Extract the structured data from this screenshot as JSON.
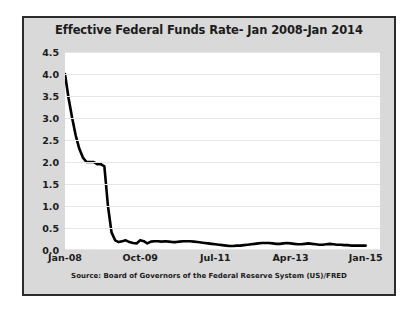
{
  "chart_data": {
    "type": "line",
    "title": "Effective Federal Funds Rate- Jan 2008-Jan 2014",
    "source_note": "Source: Board of Governors of the Federal Reserve System (US)/FRED",
    "xlabel": "",
    "ylabel": "",
    "ylim": [
      0.0,
      4.5
    ],
    "ytick_labels": [
      "0.0",
      "0.5",
      "1.0",
      "1.5",
      "2.0",
      "2.5",
      "3.0",
      "3.5",
      "4.0",
      "4.5"
    ],
    "ytick_values": [
      0.0,
      0.5,
      1.0,
      1.5,
      2.0,
      2.5,
      3.0,
      3.5,
      4.0,
      4.5
    ],
    "xtick_labels": [
      "Jan-08",
      "Oct-09",
      "Jul-11",
      "Apr-13",
      "Jan-15"
    ],
    "xtick_positions": [
      0,
      21,
      42,
      63,
      84
    ],
    "xlim": [
      0,
      88
    ],
    "grid": true,
    "legend": false,
    "line_color": "#000000",
    "line_width": 2.6,
    "plot_background": "#ffffff",
    "panel_background": "#d9d9d9",
    "border_color": "#2b2b2b",
    "series": [
      {
        "name": "Effective Federal Funds Rate",
        "x": [
          0,
          1,
          2,
          3,
          4,
          5,
          6,
          7,
          8,
          9,
          10,
          11,
          12,
          13,
          14,
          15,
          16,
          17,
          18,
          19,
          20,
          21,
          22,
          23,
          24,
          25,
          26,
          27,
          28,
          29,
          30,
          31,
          32,
          33,
          34,
          35,
          36,
          37,
          38,
          39,
          40,
          41,
          42,
          43,
          44,
          45,
          46,
          47,
          48,
          49,
          50,
          51,
          52,
          53,
          54,
          55,
          56,
          57,
          58,
          59,
          60,
          61,
          62,
          63,
          64,
          65,
          66,
          67,
          68,
          69,
          70,
          71,
          72,
          73,
          74,
          75,
          76,
          77,
          78,
          79,
          80,
          81,
          82,
          83,
          84
        ],
        "values": [
          4.0,
          3.45,
          3.0,
          2.6,
          2.3,
          2.1,
          2.0,
          2.0,
          2.0,
          1.95,
          1.95,
          1.9,
          1.0,
          0.4,
          0.22,
          0.18,
          0.2,
          0.22,
          0.18,
          0.16,
          0.15,
          0.22,
          0.2,
          0.15,
          0.19,
          0.2,
          0.2,
          0.19,
          0.2,
          0.19,
          0.18,
          0.18,
          0.19,
          0.2,
          0.2,
          0.2,
          0.19,
          0.18,
          0.17,
          0.16,
          0.15,
          0.14,
          0.13,
          0.12,
          0.11,
          0.1,
          0.09,
          0.09,
          0.1,
          0.1,
          0.11,
          0.12,
          0.13,
          0.14,
          0.15,
          0.16,
          0.16,
          0.16,
          0.15,
          0.14,
          0.14,
          0.15,
          0.16,
          0.15,
          0.14,
          0.13,
          0.13,
          0.14,
          0.15,
          0.14,
          0.13,
          0.12,
          0.12,
          0.13,
          0.14,
          0.13,
          0.12,
          0.12,
          0.11,
          0.11,
          0.1,
          0.1,
          0.1,
          0.1,
          0.1
        ]
      }
    ]
  }
}
